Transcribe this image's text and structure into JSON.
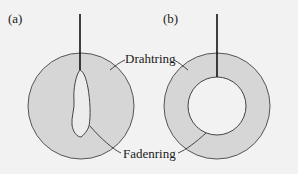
{
  "panels": [
    {
      "label": "(a)"
    },
    {
      "label": "(b)"
    }
  ],
  "labels": {
    "wire_ring": "Drahtring",
    "thread_ring": "Fadenring"
  },
  "colors": {
    "background": "#f2f2f2",
    "film_fill": "#d6d6d6",
    "outline": "#555555",
    "wire": "#111111",
    "hole": "#f2f2f2"
  }
}
